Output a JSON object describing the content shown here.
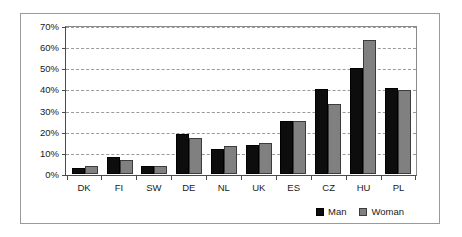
{
  "chart_data": {
    "type": "bar",
    "title": "",
    "subtitle": "",
    "xlabel": "",
    "ylabel": "",
    "ylim": [
      0,
      70
    ],
    "ytick_labels": [
      "0%",
      "10%",
      "20%",
      "30%",
      "40%",
      "50%",
      "60%",
      "70%"
    ],
    "ytick_values": [
      0,
      10,
      20,
      30,
      40,
      50,
      60,
      70
    ],
    "grid": true,
    "legend_position": "bottom-right",
    "categories": [
      "DK",
      "FI",
      "SW",
      "DE",
      "NL",
      "UK",
      "ES",
      "CZ",
      "HU",
      "PL"
    ],
    "series": [
      {
        "name": "Man",
        "color": "#0d0d0d",
        "values": [
          2.5,
          8.0,
          3.5,
          19.2,
          12.0,
          13.5,
          25.5,
          40.5,
          51.0,
          41.2
        ]
      },
      {
        "name": "Woman",
        "color": "#808080",
        "values": [
          3.4,
          6.3,
          3.5,
          17.0,
          13.2,
          14.6,
          25.2,
          33.3,
          64.2,
          40.2
        ]
      }
    ]
  },
  "legend": {
    "items": [
      {
        "label": "Man"
      },
      {
        "label": "Woman"
      }
    ]
  }
}
